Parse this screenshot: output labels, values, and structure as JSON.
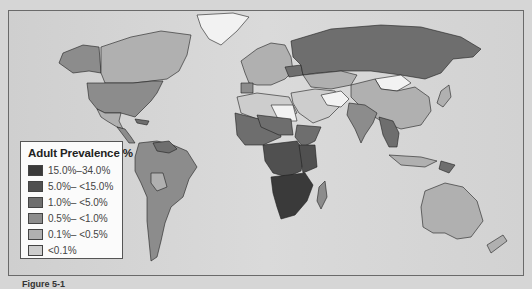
{
  "legend": {
    "title": "Adult Prevalence %",
    "items": [
      {
        "label": "15.0%–34.0%",
        "color": "#3a3a3a"
      },
      {
        "label": "5.0%– <15.0%",
        "color": "#505050"
      },
      {
        "label": "1.0%– <5.0%",
        "color": "#6e6e6e"
      },
      {
        "label": "0.5%– <1.0%",
        "color": "#8c8c8c"
      },
      {
        "label": "0.1%– <0.5%",
        "color": "#b0b0b0"
      },
      {
        "label": "<0.1%",
        "color": "#cdcdcd"
      }
    ]
  },
  "caption": "Figure 5-1",
  "colors": {
    "ocean": "#d6d6d6",
    "no_data": "#f2f2f2",
    "border": "#1e1e1e"
  }
}
